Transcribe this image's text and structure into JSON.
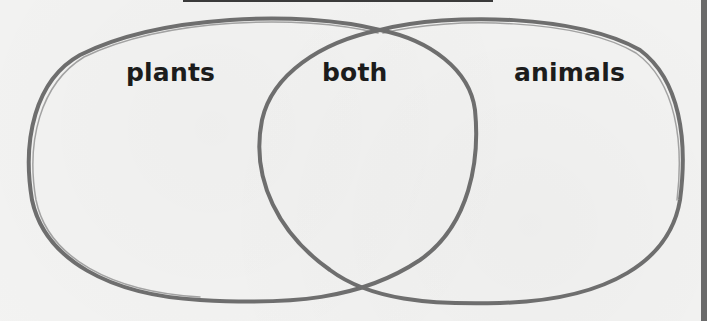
{
  "diagram": {
    "type": "venn",
    "sets": [
      {
        "id": "left",
        "label": "plants"
      },
      {
        "id": "right",
        "label": "animals"
      }
    ],
    "intersection_label": "both",
    "stroke_color": "#6e6e6e",
    "text_color": "#1c1c1c"
  }
}
